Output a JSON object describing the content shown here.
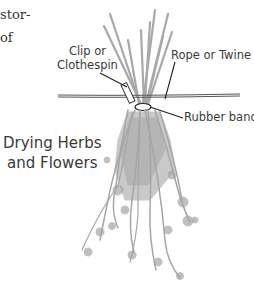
{
  "text_fragments": {
    "line1": "stor-",
    "line2": "of"
  },
  "labels": {
    "clip": [
      "Clip or",
      "Clothespin"
    ],
    "rope": "Rope or Twine",
    "band": "Rubber band"
  },
  "title": [
    "Drying Herbs",
    "and Flowers"
  ],
  "colors": {
    "herb": "#a6a6a6",
    "line": "#222222",
    "text": "#3a3a3a"
  }
}
